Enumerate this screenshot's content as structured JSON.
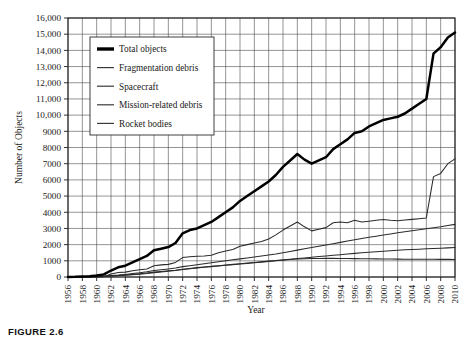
{
  "figure": {
    "caption": "FIGURE 2.6"
  },
  "chart_data": {
    "type": "line",
    "title": "",
    "xlabel": "Year",
    "ylabel": "Number of Objects",
    "xlim": [
      1956,
      2010
    ],
    "ylim": [
      0,
      16000
    ],
    "ytick_step": 1000,
    "xtick_step": 2,
    "grid": true,
    "legend_position": "top-left-inside",
    "ytick_labels": [
      "0",
      "1000",
      "2000",
      "3000",
      "4000",
      "5000",
      "6000",
      "7000",
      "8000",
      "9000",
      "10,000",
      "11,000",
      "12,000",
      "13,000",
      "14,000",
      "15,000",
      "16,000"
    ],
    "ytick_values": [
      0,
      1000,
      2000,
      3000,
      4000,
      5000,
      6000,
      7000,
      8000,
      9000,
      10000,
      11000,
      12000,
      13000,
      14000,
      15000,
      16000
    ],
    "xtick_labels": [
      "1956",
      "1958",
      "1960",
      "1962",
      "1964",
      "1966",
      "1968",
      "1970",
      "1972",
      "1974",
      "1976",
      "1978",
      "1980",
      "1982",
      "1984",
      "1986",
      "1988",
      "1990",
      "1992",
      "1994",
      "1996",
      "1998",
      "2000",
      "2002",
      "2004",
      "2006",
      "2008",
      "2010"
    ],
    "xtick_values": [
      1956,
      1958,
      1960,
      1962,
      1964,
      1966,
      1968,
      1970,
      1972,
      1974,
      1976,
      1978,
      1980,
      1982,
      1984,
      1986,
      1988,
      1990,
      1992,
      1994,
      1996,
      1998,
      2000,
      2002,
      2004,
      2006,
      2008,
      2010
    ],
    "x": [
      1956,
      1957,
      1958,
      1959,
      1960,
      1961,
      1962,
      1963,
      1964,
      1965,
      1966,
      1967,
      1968,
      1969,
      1970,
      1971,
      1972,
      1973,
      1974,
      1975,
      1976,
      1977,
      1978,
      1979,
      1980,
      1981,
      1982,
      1983,
      1984,
      1985,
      1986,
      1987,
      1988,
      1989,
      1990,
      1991,
      1992,
      1993,
      1994,
      1995,
      1996,
      1997,
      1998,
      1999,
      2000,
      2001,
      2002,
      2003,
      2004,
      2005,
      2006,
      2007,
      2008,
      2009,
      2010
    ],
    "series": [
      {
        "name": "Total objects",
        "style": "thick",
        "values": [
          0,
          10,
          30,
          50,
          90,
          160,
          400,
          600,
          700,
          900,
          1100,
          1300,
          1650,
          1750,
          1850,
          2100,
          2700,
          2900,
          3000,
          3200,
          3400,
          3700,
          4000,
          4300,
          4700,
          5000,
          5300,
          5600,
          5900,
          6300,
          6800,
          7200,
          7600,
          7250,
          7000,
          7200,
          7400,
          7900,
          8200,
          8500,
          8900,
          9000,
          9300,
          9500,
          9700,
          9800,
          9900,
          10100,
          10400,
          10700,
          11000,
          13800,
          14200,
          14800,
          15100
        ]
      },
      {
        "name": "Fragmentation debris",
        "style": "thin",
        "values": [
          0,
          0,
          0,
          0,
          5,
          20,
          180,
          280,
          300,
          380,
          450,
          500,
          700,
          750,
          780,
          900,
          1200,
          1250,
          1280,
          1300,
          1350,
          1500,
          1600,
          1700,
          1900,
          2000,
          2100,
          2200,
          2350,
          2600,
          2900,
          3150,
          3400,
          3100,
          2850,
          2950,
          3050,
          3350,
          3400,
          3350,
          3500,
          3400,
          3450,
          3500,
          3550,
          3500,
          3480,
          3520,
          3560,
          3600,
          3650,
          6200,
          6400,
          7000,
          7300
        ]
      },
      {
        "name": "Spacecraft",
        "style": "thin",
        "values": [
          1,
          3,
          8,
          15,
          30,
          50,
          90,
          120,
          160,
          210,
          260,
          320,
          400,
          450,
          500,
          560,
          640,
          700,
          760,
          820,
          880,
          940,
          1000,
          1060,
          1120,
          1180,
          1240,
          1300,
          1360,
          1420,
          1500,
          1580,
          1660,
          1740,
          1820,
          1900,
          1980,
          2060,
          2140,
          2220,
          2300,
          2380,
          2450,
          2520,
          2590,
          2660,
          2730,
          2800,
          2860,
          2920,
          2980,
          3040,
          3100,
          3180,
          3250
        ]
      },
      {
        "name": "Mission-related debris",
        "style": "thin",
        "values": [
          0,
          1,
          4,
          8,
          18,
          30,
          60,
          85,
          110,
          140,
          175,
          215,
          270,
          310,
          350,
          400,
          460,
          510,
          560,
          600,
          640,
          680,
          720,
          760,
          800,
          840,
          880,
          920,
          960,
          1000,
          1040,
          1080,
          1110,
          1130,
          1140,
          1145,
          1150,
          1150,
          1145,
          1140,
          1135,
          1130,
          1125,
          1120,
          1115,
          1110,
          1105,
          1100,
          1098,
          1096,
          1094,
          1092,
          1090,
          1088,
          1086
        ]
      },
      {
        "name": "Rocket bodies",
        "style": "thin",
        "values": [
          1,
          2,
          6,
          12,
          22,
          38,
          70,
          95,
          125,
          160,
          200,
          245,
          300,
          340,
          380,
          420,
          480,
          530,
          580,
          620,
          660,
          700,
          740,
          780,
          820,
          860,
          900,
          940,
          980,
          1020,
          1060,
          1100,
          1140,
          1180,
          1220,
          1260,
          1300,
          1340,
          1380,
          1420,
          1460,
          1500,
          1530,
          1560,
          1590,
          1620,
          1650,
          1680,
          1700,
          1720,
          1740,
          1760,
          1780,
          1800,
          1820
        ]
      }
    ]
  },
  "legend": {
    "items": [
      {
        "label": "Total objects",
        "style": "thick"
      },
      {
        "label": "Fragmentation  debris",
        "style": "thin"
      },
      {
        "label": "Spacecraft",
        "style": "thin"
      },
      {
        "label": "Mission-related debris",
        "style": "thin"
      },
      {
        "label": "Rocket bodies",
        "style": "thin"
      }
    ]
  }
}
